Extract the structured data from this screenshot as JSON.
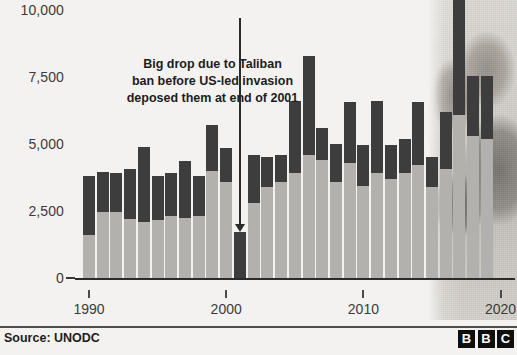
{
  "chart_data": {
    "type": "bar",
    "title": "",
    "subtitle": "",
    "xlabel": "",
    "ylabel": "",
    "stacked": true,
    "grid": false,
    "legend_position": "none",
    "ylim": [
      0,
      10000
    ],
    "yticks": [
      0,
      2500,
      5000,
      7500,
      10000
    ],
    "ytick_labels": [
      "0",
      "2,500",
      "5,000",
      "7,500",
      "10,000"
    ],
    "xticks": [
      1990,
      2000,
      2010,
      2020
    ],
    "xtick_labels": [
      "1990",
      "2000",
      "2010",
      "2020"
    ],
    "xlim": [
      1989,
      2020.5
    ],
    "categories": [
      1990,
      1991,
      1992,
      1993,
      1994,
      1995,
      1996,
      1997,
      1998,
      1999,
      2000,
      2001,
      2002,
      2003,
      2004,
      2005,
      2006,
      2007,
      2008,
      2009,
      2010,
      2011,
      2012,
      2013,
      2014,
      2015,
      2016,
      2017,
      2018,
      2019
    ],
    "series": [
      {
        "name": "lower-segment",
        "color": "#b3b1ad",
        "values": [
          1600,
          2450,
          2450,
          2200,
          2100,
          2150,
          2300,
          2250,
          2300,
          4000,
          3600,
          0,
          2800,
          3400,
          3600,
          3900,
          4600,
          4400,
          3600,
          4300,
          3450,
          3900,
          3700,
          3900,
          4200,
          3400,
          4050,
          6100,
          5300,
          5200
        ]
      },
      {
        "name": "upper-segment",
        "color": "#3d3d3d",
        "values": [
          2200,
          1500,
          1450,
          1850,
          2800,
          1650,
          1600,
          2100,
          1500,
          1700,
          1250,
          1700,
          1800,
          1100,
          1000,
          2700,
          3700,
          1200,
          1400,
          2250,
          1500,
          2700,
          1250,
          1300,
          2350,
          1100,
          2150,
          4400,
          2250,
          2350
        ]
      }
    ],
    "totals": [
      3800,
      3950,
      3900,
      4050,
      4900,
      3800,
      3900,
      4350,
      3800,
      5700,
      4850,
      1700,
      4600,
      4500,
      4600,
      6600,
      8300,
      5600,
      5000,
      6550,
      4950,
      6600,
      4950,
      5200,
      6550,
      4500,
      6200,
      10500,
      7550,
      7550
    ]
  },
  "annotation": {
    "lines": [
      "Big drop due to Taliban",
      "ban before US-led invasion",
      "deposed them at end of 2001"
    ],
    "points_to_year": 2001
  },
  "footer": {
    "source": "Source: UNODC",
    "brand_letters": [
      "B",
      "B",
      "C"
    ]
  }
}
